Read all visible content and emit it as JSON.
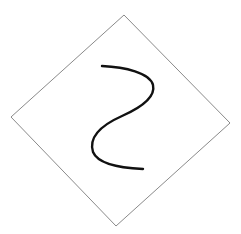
{
  "diagram": {
    "background": "#ffffff",
    "diamond": {
      "points": [
        [
          124,
          15
        ],
        [
          230,
          123
        ],
        [
          116,
          226
        ],
        [
          11,
          117
        ]
      ],
      "stroke": "#8a8a8a",
      "stroke_width": 1
    },
    "curve": {
      "path": "M102,66 C125,67 150,73 153,85 C156,98 140,108 122,116 C104,124 88,136 93,152 C98,164 120,168 143,169",
      "stroke": "#111111",
      "stroke_width": 2.4
    }
  }
}
